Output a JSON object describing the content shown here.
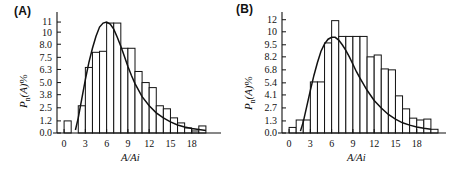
{
  "figure": {
    "panels": [
      {
        "tag": "(A)",
        "ylabel_main": "P",
        "ylabel_sub": "n",
        "ylabel_var": "(A)",
        "ylabel_pct": "%",
        "xlabel": "A/Ai"
      },
      {
        "tag": "(B)",
        "ylabel_main": "P",
        "ylabel_sub": "n",
        "ylabel_var": "(A)",
        "ylabel_pct": "%",
        "xlabel": "A/Ai"
      }
    ]
  },
  "chart_data": [
    {
      "type": "bar",
      "title": "(A)",
      "xlabel": "A/Ai",
      "ylabel": "Pn(A)%",
      "xlim": [
        -1,
        21
      ],
      "ylim": [
        0,
        11.6
      ],
      "grid": false,
      "legend": null,
      "ytick_labels": [
        "11",
        "10",
        "8.0",
        "7.5",
        "6.3",
        "5.0",
        "3.8",
        "2.5",
        "1.2",
        "0.0"
      ],
      "ytick_values": [
        11.0,
        10.0,
        8.8,
        7.5,
        6.3,
        5.0,
        3.8,
        2.5,
        1.2,
        0.0
      ],
      "xtick_labels": [
        "0",
        "3",
        "6",
        "9",
        "12",
        "15",
        "18"
      ],
      "xtick_values": [
        0,
        3,
        6,
        9,
        12,
        15,
        18
      ],
      "bin_width": 1,
      "categories": [
        0,
        1,
        2,
        3,
        4,
        5,
        6,
        7,
        8,
        9,
        10,
        11,
        12,
        13,
        14,
        15,
        16,
        17,
        18,
        19,
        20
      ],
      "values": [
        1.2,
        0.0,
        2.7,
        6.5,
        8.0,
        8.1,
        10.9,
        10.9,
        8.4,
        8.4,
        6.1,
        5.0,
        4.5,
        2.7,
        2.4,
        1.5,
        1.0,
        0.5,
        0.2,
        0.7,
        0.0
      ],
      "curve": {
        "name": "fitted-distribution",
        "x": [
          1.6,
          2.0,
          2.5,
          3.0,
          3.5,
          4.0,
          4.5,
          5.0,
          5.5,
          6.0,
          6.5,
          7.0,
          7.5,
          8.0,
          8.5,
          9.0,
          9.5,
          10.0,
          11.0,
          12.0,
          13.0,
          14.0,
          15.0,
          16.0,
          17.0,
          18.0,
          19.0,
          20.0
        ],
        "y": [
          0.3,
          1.5,
          3.4,
          5.3,
          7.0,
          8.4,
          9.6,
          10.5,
          10.9,
          11.0,
          10.8,
          10.3,
          9.5,
          8.6,
          7.6,
          6.6,
          5.7,
          4.9,
          3.6,
          2.7,
          2.0,
          1.5,
          1.1,
          0.8,
          0.6,
          0.45,
          0.35,
          0.25
        ]
      }
    },
    {
      "type": "bar",
      "title": "(B)",
      "xlabel": "A/Ai",
      "ylabel": "Pn(A)%",
      "xlim": [
        -1,
        21
      ],
      "ylim": [
        0,
        12.6
      ],
      "grid": false,
      "legend": null,
      "ytick_labels": [
        "12",
        "10",
        "9.5",
        "8.2",
        "6.8",
        "5.4",
        "4.1",
        "2.7",
        "1.3",
        "0.0"
      ],
      "ytick_values": [
        12.2,
        10.9,
        9.5,
        8.2,
        6.8,
        5.4,
        4.1,
        2.7,
        1.3,
        0.0
      ],
      "xtick_labels": [
        "0",
        "3",
        "6",
        "9",
        "12",
        "15",
        "18"
      ],
      "xtick_values": [
        0,
        3,
        6,
        9,
        12,
        15,
        18
      ],
      "bin_width": 1,
      "categories": [
        0,
        1,
        2,
        3,
        4,
        5,
        6,
        7,
        8,
        9,
        10,
        11,
        12,
        13,
        14,
        15,
        16,
        17,
        18,
        19,
        20
      ],
      "values": [
        0.6,
        1.4,
        1.4,
        5.5,
        5.5,
        9.7,
        12.1,
        10.4,
        10.4,
        10.4,
        10.4,
        8.2,
        8.4,
        6.9,
        6.8,
        4.0,
        2.6,
        1.6,
        1.4,
        1.5,
        0.4
      ],
      "curve": {
        "name": "fitted-distribution",
        "x": [
          1.6,
          2.0,
          2.5,
          3.0,
          3.5,
          4.0,
          4.5,
          5.0,
          5.5,
          6.0,
          6.5,
          7.0,
          7.5,
          8.0,
          8.5,
          9.0,
          9.5,
          10.0,
          11.0,
          12.0,
          13.0,
          14.0,
          15.0,
          16.0,
          17.0,
          18.0,
          19.0,
          20.0
        ],
        "y": [
          0.2,
          1.2,
          2.9,
          4.6,
          6.2,
          7.6,
          8.8,
          9.6,
          10.1,
          10.3,
          10.3,
          10.0,
          9.5,
          8.9,
          8.2,
          7.4,
          6.6,
          5.9,
          4.6,
          3.5,
          2.7,
          2.0,
          1.5,
          1.1,
          0.85,
          0.65,
          0.5,
          0.4
        ]
      }
    }
  ]
}
